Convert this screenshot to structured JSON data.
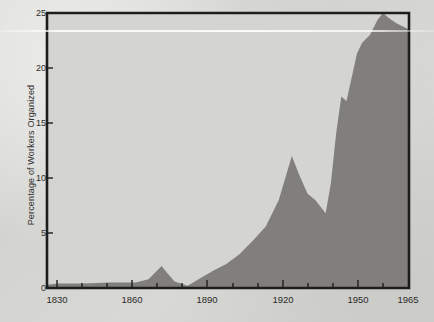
{
  "chart_data": {
    "type": "area",
    "title": "",
    "xlabel": "",
    "ylabel": "Percentage of Workers Organized",
    "xlim": [
      1826,
      1965
    ],
    "ylim": [
      0,
      25
    ],
    "grid": false,
    "legend": "none",
    "y_ticks": [
      0,
      5,
      10,
      15,
      20,
      25
    ],
    "y_tick_labels": [
      "0",
      "5",
      "10",
      "15",
      "20",
      "25"
    ],
    "x_ticks": [
      1830,
      1840,
      1850,
      1860,
      1870,
      1880,
      1890,
      1900,
      1910,
      1920,
      1930,
      1940,
      1950,
      1960
    ],
    "x_tick_labels_shown": [
      "1830",
      "1860",
      "1890",
      "1920",
      "1950",
      "1965"
    ],
    "x_labeled_values": [
      1830,
      1860,
      1890,
      1920,
      1950,
      1965
    ],
    "series": [
      {
        "name": "Percentage of Workers Organized",
        "x": [
          1826,
          1830,
          1840,
          1850,
          1860,
          1865,
          1870,
          1872,
          1875,
          1880,
          1885,
          1890,
          1895,
          1900,
          1905,
          1910,
          1915,
          1920,
          1923,
          1926,
          1929,
          1933,
          1935,
          1937,
          1939,
          1941,
          1945,
          1947,
          1950,
          1953,
          1955,
          1957,
          1960,
          1965
        ],
        "values": [
          0.3,
          0.4,
          0.4,
          0.5,
          0.5,
          0.8,
          2.0,
          1.4,
          0.6,
          0.2,
          0.9,
          1.6,
          2.2,
          3.1,
          4.3,
          5.6,
          8.0,
          12.0,
          10.2,
          8.6,
          8.0,
          6.8,
          9.5,
          14.0,
          17.4,
          17.0,
          21.3,
          22.3,
          23.0,
          24.4,
          25.0,
          24.6,
          24.1,
          23.5
        ]
      }
    ],
    "colors": {
      "area_fill": "#807f7d",
      "axis": "#1d1d1b",
      "plot_background": "#d4d4d1",
      "page_background": "#d6d6d3",
      "text": "#2b2b29"
    },
    "annotations": []
  },
  "axes": {
    "y_label": "Percentage of Workers Organized",
    "y_ticks": [
      {
        "value": 25,
        "label": "25"
      },
      {
        "value": 20,
        "label": "20"
      },
      {
        "value": 15,
        "label": "15"
      },
      {
        "value": 10,
        "label": "10"
      },
      {
        "value": 5,
        "label": "5"
      },
      {
        "value": 0,
        "label": "0"
      }
    ],
    "x_ticks": [
      {
        "value": 1830,
        "label": "1830"
      },
      {
        "value": 1860,
        "label": "1860"
      },
      {
        "value": 1890,
        "label": "1890"
      },
      {
        "value": 1920,
        "label": "1920"
      },
      {
        "value": 1950,
        "label": "1950"
      },
      {
        "value": 1965,
        "label": "1965"
      }
    ]
  }
}
